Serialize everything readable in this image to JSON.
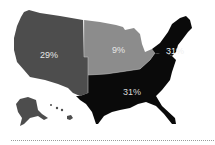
{
  "map": {
    "type": "choropleth",
    "subject": "United States regions",
    "regions": [
      {
        "name": "West",
        "value": "29%",
        "color": "#4d4d4d"
      },
      {
        "name": "Midwest",
        "value": "9%",
        "color": "#8c8c8c"
      },
      {
        "name": "Northeast",
        "value": "31%",
        "color": "#0a0a0a"
      },
      {
        "name": "South",
        "value": "31%",
        "color": "#0a0a0a"
      }
    ],
    "inset_states": [
      "Alaska",
      "Hawaii"
    ],
    "divider_color": "#9a9a9a"
  }
}
